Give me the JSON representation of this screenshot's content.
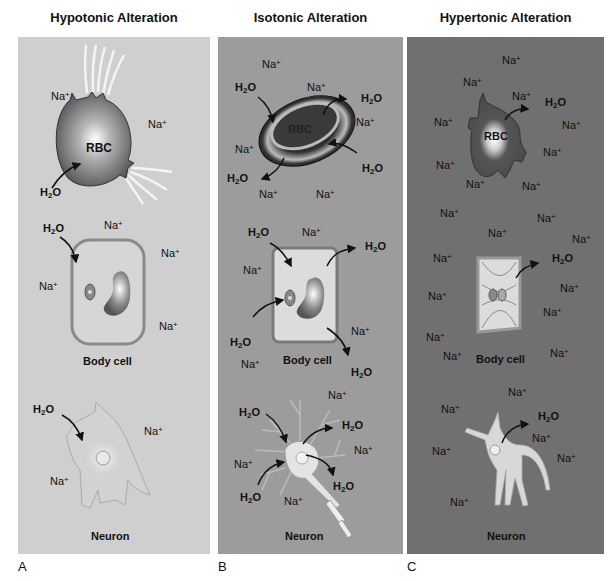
{
  "figure": {
    "panels": [
      {
        "id": "A",
        "title": "Hypotonic Alteration",
        "letter": "A",
        "bg": "#cfcfcf",
        "rbc": {
          "label": "RBC",
          "ions": [
            "Na+",
            "Na+"
          ],
          "water": [
            "H2O"
          ]
        },
        "body_cell": {
          "label": "Body cell",
          "ions": [
            "Na+",
            "Na+",
            "Na+",
            "Na+"
          ],
          "water": [
            "H2O"
          ]
        },
        "neuron": {
          "label": "Neuron",
          "ions": [
            "Na+",
            "Na+"
          ],
          "water": [
            "H2O"
          ]
        }
      },
      {
        "id": "B",
        "title": "Isotonic Alteration",
        "letter": "B",
        "bg": "#9c9c9c",
        "rbc": {
          "label": "RBC",
          "ions": [
            "Na+",
            "Na+",
            "Na+",
            "Na+",
            "Na+",
            "Na+"
          ],
          "water": [
            "H2O",
            "H2O",
            "H2O",
            "H2O"
          ]
        },
        "body_cell": {
          "label": "Body cell",
          "ions": [
            "Na+",
            "Na+",
            "Na+",
            "Na+"
          ],
          "water": [
            "H2O",
            "H2O",
            "H2O",
            "H2O"
          ]
        },
        "neuron": {
          "label": "Neuron",
          "ions": [
            "Na+",
            "Na+",
            "Na+",
            "Na+"
          ],
          "water": [
            "H2O",
            "H2O",
            "H2O",
            "H2O"
          ]
        }
      },
      {
        "id": "C",
        "title": "Hypertonic Alteration",
        "letter": "C",
        "bg": "#707070",
        "rbc": {
          "label": "RBC",
          "ions": [
            "Na+",
            "Na+",
            "Na+",
            "Na+",
            "Na+",
            "Na+",
            "Na+",
            "Na+",
            "Na+"
          ],
          "water": [
            "H2O"
          ]
        },
        "body_cell": {
          "label": "Body cell",
          "ions": [
            "Na+",
            "Na+",
            "Na+",
            "Na+",
            "Na+",
            "Na+",
            "Na+",
            "Na+",
            "Na+",
            "Na+",
            "Na+",
            "Na+"
          ],
          "water": [
            "H2O"
          ]
        },
        "neuron": {
          "label": "Neuron",
          "ions": [
            "Na+",
            "Na+",
            "Na+",
            "Na+",
            "Na+",
            "Na+"
          ],
          "water": [
            "H2O"
          ]
        }
      }
    ],
    "symbols": {
      "sodium": "Na",
      "sodium_charge": "+",
      "water_h": "H",
      "water_2": "2",
      "water_o": "O"
    }
  }
}
